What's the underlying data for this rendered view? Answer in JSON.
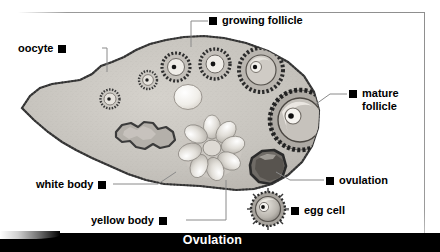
{
  "figure": {
    "caption": "Ovulation",
    "labels": [
      {
        "id": "oocyte",
        "text": "oocyte",
        "side": "left",
        "marker": "filled-square"
      },
      {
        "id": "growing-follicle",
        "text": "growing follicle",
        "side": "right",
        "marker": "filled-square"
      },
      {
        "id": "mature-follicle",
        "text": "mature",
        "text2": "follicle",
        "side": "right",
        "marker": "filled-square"
      },
      {
        "id": "ovulation",
        "text": "ovulation",
        "side": "right",
        "marker": "filled-square"
      },
      {
        "id": "egg-cell",
        "text": "egg cell",
        "side": "right",
        "marker": "filled-square"
      },
      {
        "id": "white-body",
        "text": "white body",
        "side": "left",
        "marker": "filled-square"
      },
      {
        "id": "yellow-body",
        "text": "yellow body",
        "side": "left",
        "marker": "filled-square"
      }
    ],
    "colors": {
      "background": "#ffffff",
      "caption_bar": "#000000",
      "caption_text": "#ffffff",
      "label_text": "#000000",
      "leader_line": "#8a8a8a",
      "stroma": "#c9c6c0",
      "cortex_edge": "#4a4a4a",
      "antrum": "#f2f0ec"
    }
  }
}
